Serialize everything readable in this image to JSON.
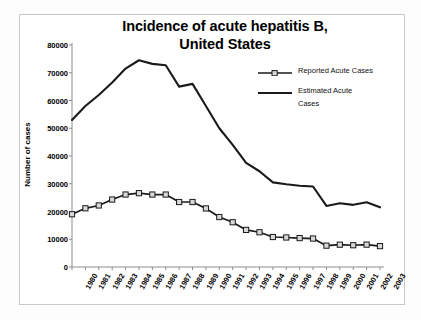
{
  "chart_data": {
    "type": "line",
    "title": "Incidence of acute hepatitis B, United States",
    "title_line1": "Incidence of acute hepatitis B,",
    "title_line2": "United States",
    "xlabel": "",
    "ylabel": "Number of cases",
    "ylim": [
      0,
      80000
    ],
    "ytick_step": 10000,
    "yticks": [
      "80000",
      "70000",
      "60000",
      "50000",
      "40000",
      "30000",
      "20000",
      "10000",
      "0"
    ],
    "ytick_values": [
      80000,
      70000,
      60000,
      50000,
      40000,
      30000,
      20000,
      10000,
      0
    ],
    "grid": false,
    "legend_position": "upper right",
    "categories": [
      "1980",
      "1981",
      "1982",
      "1983",
      "1984",
      "1985",
      "1986",
      "1987",
      "1988",
      "1989",
      "1990",
      "1991",
      "1992",
      "1993",
      "1994",
      "1995",
      "1996",
      "1997",
      "1998",
      "1999",
      "2000",
      "2001",
      "2002",
      "2003"
    ],
    "series": [
      {
        "name": "Reported Acute Cases",
        "marker": "open-square",
        "values": [
          19015,
          21152,
          22177,
          24318,
          26115,
          26611,
          26107,
          26107,
          23419,
          23419,
          21102,
          18003,
          16126,
          13361,
          12517,
          10805,
          10637,
          10416,
          10258,
          7694,
          8036,
          7844,
          8064,
          7526
        ]
      },
      {
        "name": "Estimated Acute Cases",
        "marker": "none",
        "values": [
          53000,
          58000,
          62000,
          66500,
          71500,
          74500,
          73200,
          72700,
          65000,
          66000,
          58000,
          50000,
          44000,
          37500,
          34500,
          30500,
          29800,
          29300,
          29000,
          22000,
          23000,
          22400,
          23300,
          21500
        ]
      }
    ]
  },
  "legend": {
    "items": [
      {
        "label": "Reported Acute Cases",
        "symbol": "line-with-square-marker"
      },
      {
        "label_line1": "Estimated Acute",
        "label_line2": "Cases",
        "label": "Estimated Acute Cases",
        "symbol": "plain-line"
      }
    ]
  },
  "colors": {
    "line": "#1a1a1a",
    "marker_fill": "#d8d8d8",
    "axis": "#8c8c8c",
    "frame": "#c9c9c9",
    "text": "#000000"
  }
}
